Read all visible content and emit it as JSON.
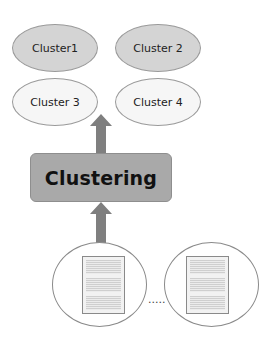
{
  "diagram": {
    "title_fragment": "",
    "clusters": [
      {
        "label": "Cluster1",
        "style": "dark"
      },
      {
        "label": "Cluster 2",
        "style": "dark"
      },
      {
        "label": "Cluster 3",
        "style": "light"
      },
      {
        "label": "Cluster 4",
        "style": "light"
      }
    ],
    "process": {
      "label": "Clustering"
    },
    "documents": {
      "count_shown": 2,
      "ellipsis": "....."
    },
    "colors": {
      "cluster_dark": "#d4d4d4",
      "cluster_light": "#f6f6f6",
      "process_box": "#a9a9a9",
      "arrow": "#7f7f7f"
    }
  }
}
